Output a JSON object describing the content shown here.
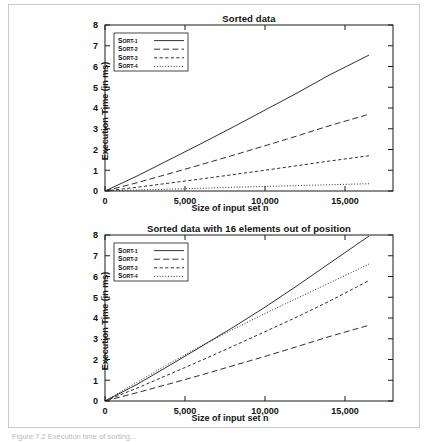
{
  "page": {
    "caption_fragment": "Figure 7.2  Execution time of sorting..."
  },
  "charts": [
    {
      "id": "chart-top",
      "title": "Sorted data",
      "xlabel": "Size of input set n",
      "ylabel": "Execution Time (in ms)",
      "xticks": [
        "0",
        "5,000",
        "10,000",
        "15,000"
      ],
      "yticks": [
        "0",
        "1",
        "2",
        "3",
        "4",
        "5",
        "6",
        "7",
        "8"
      ],
      "legend": [
        "Sort-1",
        "Sort-2",
        "Sort-3",
        "Sort-4"
      ]
    },
    {
      "id": "chart-bottom",
      "title": "Sorted data with 16 elements out of position",
      "xlabel": "Size of input set n",
      "ylabel": "Execution Time (in ms)",
      "xticks": [
        "0",
        "5,000",
        "10,000",
        "15,000"
      ],
      "yticks": [
        "0",
        "1",
        "2",
        "3",
        "4",
        "5",
        "6",
        "7",
        "8"
      ],
      "legend": [
        "Sort-1",
        "Sort-2",
        "Sort-3",
        "Sort-4"
      ]
    }
  ],
  "chart_data": [
    {
      "type": "line",
      "title": "Sorted data",
      "xlabel": "Size of input set n",
      "ylabel": "Execution Time (in ms)",
      "xlim": [
        0,
        18000
      ],
      "ylim": [
        0,
        8
      ],
      "xticks": [
        0,
        5000,
        10000,
        15000
      ],
      "yticks": [
        0,
        1,
        2,
        3,
        4,
        5,
        6,
        7,
        8
      ],
      "grid": false,
      "legend_position": "upper-left",
      "x": [
        0,
        2000,
        4000,
        6000,
        8000,
        10000,
        12000,
        14000,
        16500
      ],
      "series": [
        {
          "name": "Sort-1",
          "style": "solid",
          "values": [
            0.0,
            0.72,
            1.5,
            2.28,
            3.08,
            3.9,
            4.72,
            5.58,
            6.55
          ]
        },
        {
          "name": "Sort-2",
          "style": "dashed",
          "values": [
            0.0,
            0.4,
            0.83,
            1.27,
            1.72,
            2.18,
            2.65,
            3.14,
            3.7
          ]
        },
        {
          "name": "Sort-3",
          "style": "short-dash",
          "values": [
            0.0,
            0.18,
            0.38,
            0.58,
            0.79,
            1.0,
            1.22,
            1.44,
            1.7
          ]
        },
        {
          "name": "Sort-4",
          "style": "dotted",
          "values": [
            0.0,
            0.05,
            0.09,
            0.13,
            0.18,
            0.22,
            0.26,
            0.3,
            0.35
          ]
        }
      ]
    },
    {
      "type": "line",
      "title": "Sorted data with 16 elements out of position",
      "xlabel": "Size of input set n",
      "ylabel": "Execution Time (in ms)",
      "xlim": [
        0,
        18000
      ],
      "ylim": [
        0,
        8
      ],
      "xticks": [
        0,
        5000,
        10000,
        15000
      ],
      "yticks": [
        0,
        1,
        2,
        3,
        4,
        5,
        6,
        7,
        8
      ],
      "grid": false,
      "legend_position": "upper-left",
      "x": [
        0,
        2000,
        4000,
        6000,
        8000,
        10000,
        12000,
        14000,
        16500
      ],
      "series": [
        {
          "name": "Sort-1",
          "style": "solid",
          "values": [
            0.0,
            0.8,
            1.7,
            2.62,
            3.55,
            4.52,
            5.55,
            6.62,
            7.95
          ]
        },
        {
          "name": "Sort-2",
          "style": "dashed",
          "values": [
            0.0,
            0.4,
            0.82,
            1.25,
            1.7,
            2.15,
            2.62,
            3.1,
            3.65
          ]
        },
        {
          "name": "Sort-3",
          "style": "short-dash",
          "values": [
            0.0,
            0.62,
            1.28,
            1.95,
            2.64,
            3.34,
            4.05,
            4.8,
            5.8
          ]
        },
        {
          "name": "Sort-4",
          "style": "dotted",
          "values": [
            0.0,
            0.9,
            1.8,
            2.65,
            3.45,
            4.22,
            4.95,
            5.68,
            6.6
          ]
        }
      ]
    }
  ]
}
